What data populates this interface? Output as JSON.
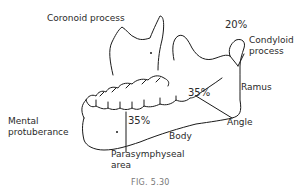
{
  "figure": {
    "caption": "FIG. 5.30",
    "labels": {
      "coronoid": "Coronoid process",
      "condyloid_line1": "Condyloid",
      "condyloid_line2": "process",
      "ramus": "Ramus",
      "angle": "Angle",
      "body": "Body",
      "parasymphyseal_line1": "Parasymphyseal",
      "parasymphyseal_line2": "area",
      "mental_line1": "Mental",
      "mental_line2": "protuberance"
    },
    "percentages": {
      "condyle": "20%",
      "angle_body": "35%",
      "parasymphyseal": "35%"
    },
    "colors": {
      "line": "#1a1a1a",
      "text": "#2a2a2a",
      "caption": "#777777"
    }
  }
}
